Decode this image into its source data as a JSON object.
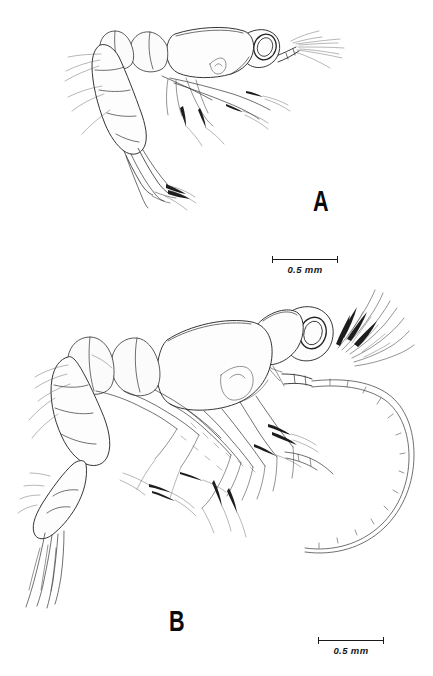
{
  "plate": {
    "title": "Crustacean larval stages lateral view plate",
    "background_color": "#ffffff",
    "ink_color": "#1a1a1a"
  },
  "panels": [
    {
      "id": "A",
      "label": "A",
      "description": "Lateral view of early larval stage with short abdomen, stalked compound eye, carapace and setose thoracic appendages",
      "scalebar": {
        "label": "0.5 mm",
        "value": 0.5,
        "unit": "mm",
        "length_px": 66
      }
    },
    {
      "id": "B",
      "label": "B",
      "description": "Lateral view of later larval stage with enlarged carapace, plumose antennal setae, long segmented antennal flagellum, segmented abdomen and telson with uropods",
      "scalebar": {
        "label": "0.5 mm",
        "value": 0.5,
        "unit": "mm",
        "length_px": 66
      }
    }
  ]
}
